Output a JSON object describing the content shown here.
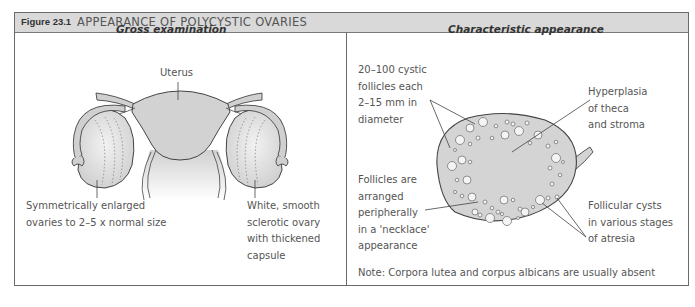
{
  "figure": {
    "label": "Figure 23.1",
    "title": "APPEARANCE OF POLYCYSTIC OVARIES"
  },
  "left_panel": {
    "title": "Gross examination",
    "labels": {
      "uterus": "Uterus",
      "enlarged": "Symmetrically enlarged\novaries to 2–5 x normal size",
      "sclerotic": "White, smooth\nsclerotic ovary\nwith thickened\ncapsule"
    }
  },
  "right_panel": {
    "title": "Characteristic appearance",
    "labels": {
      "cystic_follicles": "20–100 cystic\nfollicles each\n2–15 mm in\ndiameter",
      "hyperplasia": "Hyperplasia\nof theca\nand stroma",
      "necklace": "Follicles are\narranged\nperipherally\nin a 'necklace'\nappearance",
      "atresia": "Follicular cysts\nin various stages\nof atresia",
      "note": "Note: Corpora lutea and corpus albicans are usually absent"
    }
  },
  "colors": {
    "header_bg": "#d9d9d9",
    "border": "#6a6a6a",
    "tissue_fill": "#d4d4d4",
    "text": "#555555"
  }
}
